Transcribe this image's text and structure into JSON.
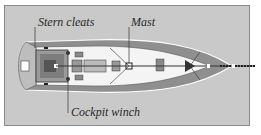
{
  "diagram": {
    "labels": {
      "stern_cleats": "Stern cleats",
      "mast": "Mast",
      "cockpit_winch": "Cockpit winch"
    },
    "colors": {
      "background_panel": "#c9c9c9",
      "hull_side": "#8c8c8c",
      "deck": "#f4f4f4",
      "lines": "#333333"
    }
  }
}
